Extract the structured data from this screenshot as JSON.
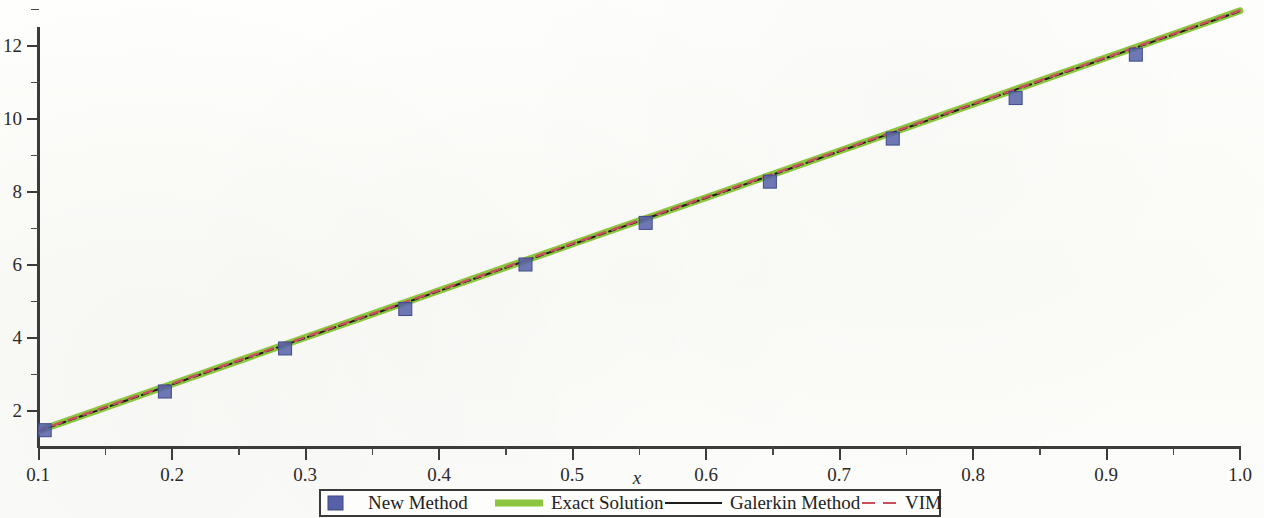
{
  "figure": {
    "background_color": "#fdfdfb"
  },
  "chart_data": {
    "type": "line",
    "title": "",
    "subtitle": "",
    "xlabel": "x",
    "ylabel": "",
    "xlim": [
      0.1,
      1.0
    ],
    "ylim": [
      1.05,
      12.98
    ],
    "grid": false,
    "legend_position": "below-center",
    "x_ticks_major": [
      "0.1",
      "0.2",
      "0.3",
      "0.4",
      "0.5",
      "0.6",
      "0.7",
      "0.8",
      "0.9",
      "1.0"
    ],
    "x_tick_values": [
      0.1,
      0.2,
      0.3,
      0.4,
      0.5,
      0.6,
      0.7,
      0.8,
      0.9,
      1.0
    ],
    "x_minor_ticks": [
      0.15,
      0.25,
      0.35,
      0.45,
      0.55,
      0.65,
      0.75,
      0.85,
      0.95
    ],
    "y_ticks_major": [
      "2",
      "4",
      "6",
      "8",
      "10",
      "12"
    ],
    "y_tick_values": [
      2,
      4,
      6,
      8,
      10,
      12
    ],
    "y_minor_ticks": [
      1,
      3,
      5,
      7,
      9,
      11
    ],
    "x": [
      0.1,
      0.15,
      0.2,
      0.25,
      0.3,
      0.35,
      0.4,
      0.45,
      0.5,
      0.55,
      0.6,
      0.65,
      0.7,
      0.75,
      0.8,
      0.85,
      0.9,
      0.95,
      1.0
    ],
    "series": [
      {
        "name": "Exact Solution",
        "style": "solid-thick",
        "color": "#8cc63f",
        "width": 7,
        "values": [
          1.44,
          2.08,
          2.72,
          3.36,
          4.0,
          4.64,
          5.28,
          5.92,
          6.56,
          7.2,
          7.83,
          8.47,
          9.11,
          9.75,
          10.39,
          11.03,
          11.67,
          12.31,
          12.95
        ]
      },
      {
        "name": "Galerkin Method",
        "style": "solid-thin",
        "color": "#1c1c1c",
        "width": 2,
        "values": [
          1.43,
          2.07,
          2.71,
          3.35,
          3.99,
          4.63,
          5.27,
          5.91,
          6.55,
          7.19,
          7.82,
          8.46,
          9.1,
          9.74,
          10.38,
          11.02,
          11.66,
          12.3,
          12.94
        ]
      },
      {
        "name": "VIM",
        "style": "dashed",
        "color": "#c94f5e",
        "width": 2.4,
        "values": [
          1.45,
          2.09,
          2.73,
          3.37,
          4.01,
          4.65,
          5.29,
          5.93,
          6.57,
          7.21,
          7.84,
          8.48,
          9.12,
          9.76,
          10.4,
          11.04,
          11.68,
          12.32,
          12.96
        ]
      },
      {
        "name": "New Method",
        "style": "markers",
        "marker": "square",
        "color": "#5560a8",
        "marker_size": 13,
        "x": [
          0.105,
          0.195,
          0.285,
          0.375,
          0.465,
          0.555,
          0.648,
          0.74,
          0.832,
          0.922
        ],
        "values": [
          1.46,
          2.52,
          3.7,
          4.78,
          6.0,
          7.14,
          8.27,
          9.45,
          10.56,
          11.75
        ]
      }
    ]
  },
  "legend": {
    "entries": [
      {
        "label": "New Method",
        "swatch": "square-marker",
        "color": "#5560a8"
      },
      {
        "label": "Exact Solution",
        "swatch": "thick-line",
        "color": "#8cc63f"
      },
      {
        "label": "Galerkin Method",
        "swatch": "thin-line",
        "color": "#1c1c1c"
      },
      {
        "label": "VIM",
        "swatch": "dashed-line",
        "color": "#c94f5e"
      }
    ]
  },
  "axes": {
    "x_label": "x"
  }
}
